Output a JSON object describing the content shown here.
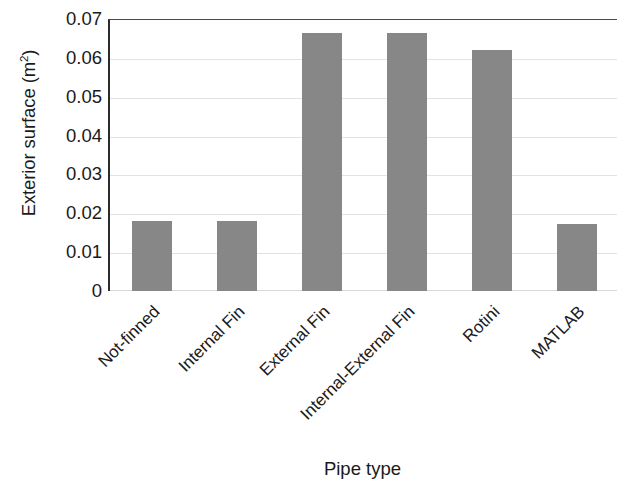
{
  "chart_data": {
    "type": "bar",
    "title": "",
    "xlabel": "Pipe type",
    "ylabel": "Exterior surface (m²)",
    "ylabel_text": "Exterior surface (m",
    "ylabel_sup": "2",
    "ylabel_tail": ")",
    "categories": [
      "Not-finned",
      "Internal Fin",
      "External Fin",
      "Internal-External Fin",
      "Rotini",
      "MATLAB"
    ],
    "values": [
      0.018,
      0.018,
      0.0665,
      0.0665,
      0.062,
      0.0172
    ],
    "ylim": [
      0,
      0.07
    ],
    "ytick_values": [
      0.07,
      0.06,
      0.05,
      0.04,
      0.03,
      0.02,
      0.01,
      0
    ],
    "ytick_labels": [
      "0.07",
      "0.06",
      "0.05",
      "0.04",
      "0.03",
      "0.02",
      "0.01",
      "0"
    ],
    "grid": true,
    "grid_axis": "y",
    "legend": false,
    "bar_color": "#878787",
    "axis_color": "#2c2c2c",
    "gridline_color": "#e2e2e2",
    "xtick_rotation": -45,
    "series": [
      {
        "name": "Exterior surface",
        "values": [
          0.018,
          0.018,
          0.0665,
          0.0665,
          0.062,
          0.0172
        ]
      }
    ]
  }
}
